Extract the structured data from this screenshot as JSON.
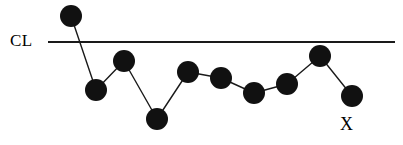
{
  "chart_data": {
    "type": "line",
    "title": "",
    "xlabel": "X",
    "ylabel": "",
    "grid": false,
    "legend": null,
    "annotations": [
      {
        "name": "center-line-label",
        "text": "CL",
        "x": 10,
        "y": 32
      },
      {
        "name": "x-axis-label",
        "text": "X",
        "x": 340,
        "y": 116
      }
    ],
    "reference_lines": [
      {
        "name": "center-line",
        "label": "CL",
        "y_pixel": 42,
        "x_start": 48,
        "x_end": 395,
        "color": "#1a1a1a",
        "width": 2
      }
    ],
    "series": [
      {
        "name": "observations",
        "marker": "filled-circle",
        "marker_radius": 11,
        "marker_color": "#111111",
        "line_color": "#1a1a1a",
        "line_width": 1.4,
        "points": [
          {
            "i": 1,
            "x": 71,
            "y": 16
          },
          {
            "i": 2,
            "x": 96,
            "y": 90
          },
          {
            "i": 3,
            "x": 124,
            "y": 61
          },
          {
            "i": 4,
            "x": 157,
            "y": 119
          },
          {
            "i": 5,
            "x": 188,
            "y": 72
          },
          {
            "i": 6,
            "x": 221,
            "y": 78
          },
          {
            "i": 7,
            "x": 254,
            "y": 93
          },
          {
            "i": 8,
            "x": 287,
            "y": 84
          },
          {
            "i": 9,
            "x": 320,
            "y": 56
          },
          {
            "i": 10,
            "x": 352,
            "y": 96
          }
        ]
      }
    ],
    "xlim": [
      48,
      395
    ],
    "ylim": [
      145,
      0
    ]
  },
  "labels": {
    "center_line": "CL",
    "x_axis": "X"
  },
  "colors": {
    "marker": "#111111",
    "line": "#1a1a1a",
    "center_line": "#1a1a1a",
    "background": "#ffffff",
    "text": "#000000"
  }
}
